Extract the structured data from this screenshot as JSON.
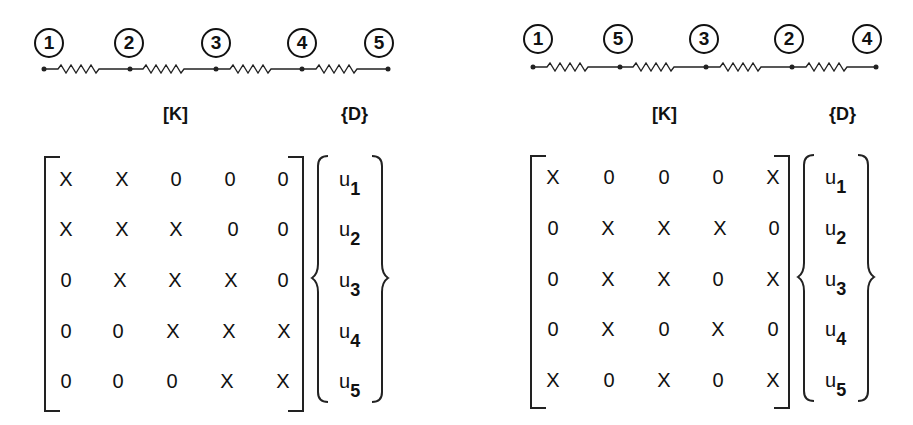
{
  "panels": [
    {
      "id": "left",
      "node_order": [
        "1",
        "2",
        "3",
        "4",
        "5"
      ],
      "matrix_label": "[K]",
      "vector_label": "{D}",
      "matrix": [
        [
          "X",
          "X",
          "0",
          "0",
          "0"
        ],
        [
          "X",
          "X",
          "X",
          "0",
          "0"
        ],
        [
          "0",
          "X",
          "X",
          "X",
          "0"
        ],
        [
          "0",
          "0",
          "X",
          "X",
          "X"
        ],
        [
          "0",
          "0",
          "0",
          "X",
          "X"
        ]
      ],
      "vector": [
        {
          "base": "u",
          "sub": "1"
        },
        {
          "base": "u",
          "sub": "2"
        },
        {
          "base": "u",
          "sub": "3"
        },
        {
          "base": "u",
          "sub": "4"
        },
        {
          "base": "u",
          "sub": "5"
        }
      ]
    },
    {
      "id": "right",
      "node_order": [
        "1",
        "5",
        "3",
        "2",
        "4"
      ],
      "matrix_label": "[K]",
      "vector_label": "{D}",
      "matrix": [
        [
          "X",
          "0",
          "0",
          "0",
          "X"
        ],
        [
          "0",
          "X",
          "X",
          "X",
          "0"
        ],
        [
          "0",
          "X",
          "X",
          "0",
          "X"
        ],
        [
          "0",
          "X",
          "0",
          "X",
          "0"
        ],
        [
          "X",
          "0",
          "X",
          "0",
          "X"
        ]
      ],
      "vector": [
        {
          "base": "u",
          "sub": "1"
        },
        {
          "base": "u",
          "sub": "2"
        },
        {
          "base": "u",
          "sub": "3"
        },
        {
          "base": "u",
          "sub": "4"
        },
        {
          "base": "u",
          "sub": "5"
        }
      ]
    }
  ]
}
